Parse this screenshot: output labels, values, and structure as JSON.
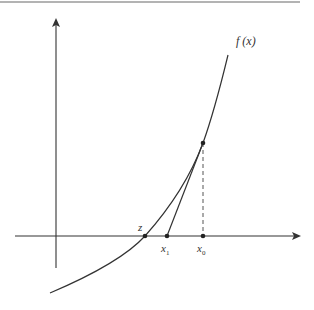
{
  "diagram": {
    "colors": {
      "stroke": "#333333",
      "top_rule": "#9a9a9a",
      "background": "#ffffff"
    },
    "labels": {
      "function": "f (x)",
      "root": "z",
      "x1_base": "x",
      "x1_sub": "1",
      "x0_base": "x",
      "x0_sub": "0"
    },
    "points": {
      "root_z": {
        "x": 145,
        "y": 236
      },
      "x1": {
        "x": 167,
        "y": 236
      },
      "x0": {
        "x": 203,
        "y": 236
      },
      "tangent_point": {
        "x": 203,
        "y": 143
      }
    },
    "axes": {
      "x_axis": {
        "y": 236,
        "x_start": 15,
        "x_end": 300
      },
      "y_axis": {
        "x": 56,
        "y_start": 268,
        "y_end": 20
      }
    }
  }
}
